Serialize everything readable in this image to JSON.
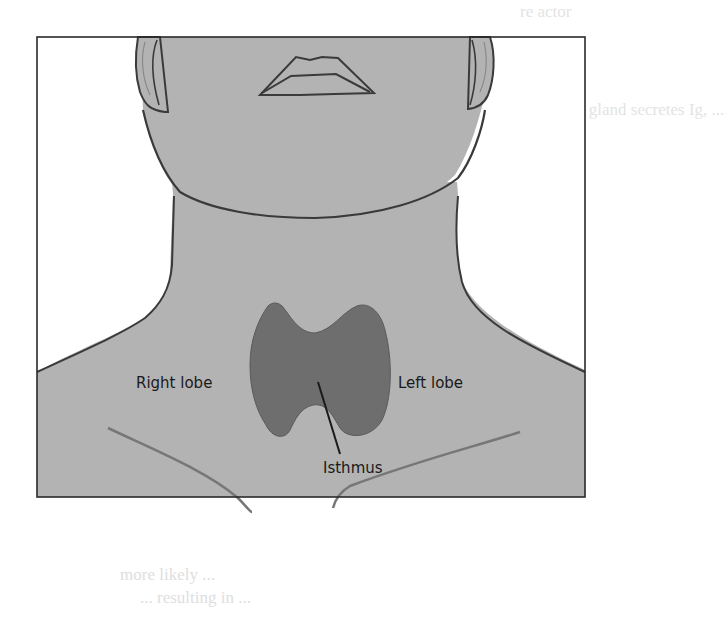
{
  "figure": {
    "labels": {
      "right_lobe": "Right lobe",
      "left_lobe": "Left lobe",
      "isthmus": "Isthmus"
    },
    "colors": {
      "skin": "#b3b3b3",
      "outline": "#3a3a3a",
      "thyroid": "#6e6e6e",
      "frame": "#2a2a2a",
      "background": "#ffffff"
    }
  },
  "bleed_through_text": [
    "re actor",
    "t pituitary gland secretes Ig, ...",
    "cause",
    "ble for the gland's production of T4 and ...",
    "through the blood",
    "... ...",
    "more likely ...",
    "... resulting in ...",
    "... weakness"
  ]
}
